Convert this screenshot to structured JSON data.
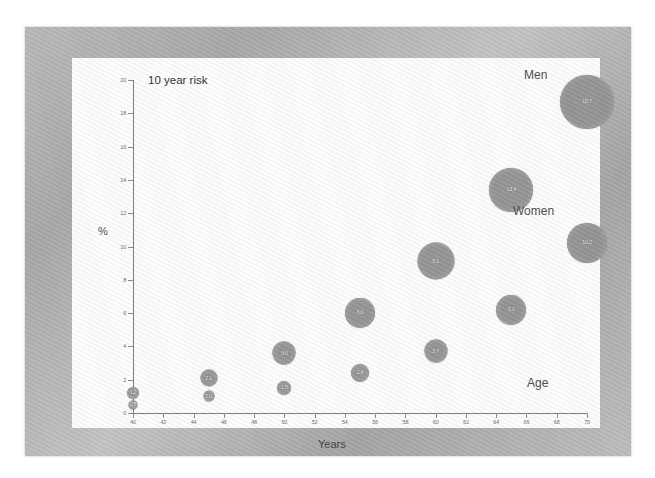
{
  "chart_data": {
    "type": "scatter",
    "title": "10 year risk",
    "xlabel": "Years",
    "ylabel": "%",
    "xlim": [
      40,
      70
    ],
    "ylim": [
      0,
      20
    ],
    "grid": false,
    "legend_position": "inline-annotations",
    "x_ticks": [
      40,
      42,
      44,
      46,
      48,
      50,
      52,
      54,
      56,
      58,
      60,
      62,
      64,
      66,
      68,
      70
    ],
    "y_ticks": [
      0,
      2,
      4,
      6,
      8,
      10,
      12,
      14,
      16,
      18,
      20
    ],
    "annotations": [
      {
        "text": "Men",
        "x": 69,
        "y": 20.6
      },
      {
        "text": "Women",
        "x": 68.5,
        "y": 12.2
      },
      {
        "text": "Age",
        "x": 69,
        "y": 1.4
      },
      {
        "text": "10 year risk",
        "x": 41,
        "y": 19.8
      }
    ],
    "series": [
      {
        "name": "Men",
        "color": "#949494",
        "points": [
          {
            "x": 40,
            "y": 1.2,
            "size": 12,
            "label": "1.2"
          },
          {
            "x": 45,
            "y": 2.1,
            "size": 17,
            "label": "2.1"
          },
          {
            "x": 50,
            "y": 3.6,
            "size": 23,
            "label": "3.6"
          },
          {
            "x": 55,
            "y": 6.0,
            "size": 30,
            "label": "6.0"
          },
          {
            "x": 60,
            "y": 9.1,
            "size": 37,
            "label": "9.1"
          },
          {
            "x": 65,
            "y": 13.4,
            "size": 44,
            "label": "13.4"
          },
          {
            "x": 70,
            "y": 18.7,
            "size": 54,
            "label": "18.7"
          }
        ]
      },
      {
        "name": "Women",
        "color": "#949494",
        "points": [
          {
            "x": 40,
            "y": 0.5,
            "size": 9,
            "label": "0.5"
          },
          {
            "x": 45,
            "y": 1.0,
            "size": 11,
            "label": "1.0"
          },
          {
            "x": 50,
            "y": 1.5,
            "size": 14,
            "label": "1.5"
          },
          {
            "x": 55,
            "y": 2.4,
            "size": 18,
            "label": "2.4"
          },
          {
            "x": 60,
            "y": 3.7,
            "size": 23,
            "label": "3.7"
          },
          {
            "x": 65,
            "y": 6.2,
            "size": 30,
            "label": "6.2"
          },
          {
            "x": 70,
            "y": 10.2,
            "size": 40,
            "label": "10.2"
          }
        ]
      }
    ]
  },
  "labels": {
    "chart_title": "10 year risk",
    "x_axis_title": "Years",
    "y_axis_title": "%",
    "men": "Men",
    "women": "Women",
    "age": "Age"
  },
  "colors": {
    "bubble": "#949494",
    "bubble_text": "#efefef",
    "axis": "#7c7c7c",
    "frame": "#b4b4b4",
    "paper": "#fdfdfd"
  }
}
